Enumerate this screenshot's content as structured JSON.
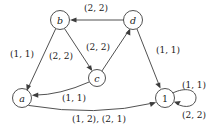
{
  "figure": {
    "type": "directed-graph",
    "title": "",
    "width": 217,
    "height": 134,
    "background_color": "#ffffff",
    "stroke_color": "#3d3d3d",
    "text_color": "#1a1a1a"
  },
  "nodes": [
    {
      "id": "b",
      "label": "b",
      "x": 60,
      "y": 20,
      "r": 9.5,
      "italic": true
    },
    {
      "id": "d",
      "label": "d",
      "x": 133,
      "y": 20,
      "r": 9.5,
      "italic": true
    },
    {
      "id": "c",
      "label": "c",
      "x": 97,
      "y": 78,
      "r": 8.5,
      "italic": true
    },
    {
      "id": "a",
      "label": "a",
      "x": 22,
      "y": 98,
      "r": 9.5,
      "italic": true
    },
    {
      "id": "1",
      "label": "1",
      "x": 165,
      "y": 98,
      "r": 9.5,
      "italic": false
    }
  ],
  "edges": [
    {
      "id": "d-to-b",
      "from": "d",
      "to": "b",
      "label": "(2, 2)",
      "label_x": 96,
      "label_y": 8
    },
    {
      "id": "b-to-a",
      "from": "b",
      "to": "a",
      "label": "(1, 1)",
      "label_x": 22,
      "label_y": 54
    },
    {
      "id": "b-to-c",
      "from": "b",
      "to": "c",
      "label": "(2, 2)",
      "label_x": 61,
      "label_y": 56
    },
    {
      "id": "c-to-d",
      "from": "c",
      "to": "d",
      "label": "(2, 2)",
      "label_x": 98,
      "label_y": 47
    },
    {
      "id": "d-to-1",
      "from": "d",
      "to": "1",
      "label": "(1, 1)",
      "label_x": 168,
      "label_y": 50
    },
    {
      "id": "c-to-a",
      "from": "c",
      "to": "a",
      "label": "(1, 1)",
      "label_x": 74,
      "label_y": 98
    },
    {
      "id": "a-to-1",
      "from": "a",
      "to": "1",
      "label": "(1, 2), (2, 1)",
      "label_x": 99,
      "label_y": 119
    },
    {
      "id": "1-self-top",
      "from": "1",
      "to": "1",
      "label": "(1, 1)",
      "label_x": 194,
      "label_y": 85
    },
    {
      "id": "1-self-bottom",
      "from": "1",
      "to": "1",
      "label": "(2, 2)",
      "label_x": 194,
      "label_y": 115
    }
  ]
}
